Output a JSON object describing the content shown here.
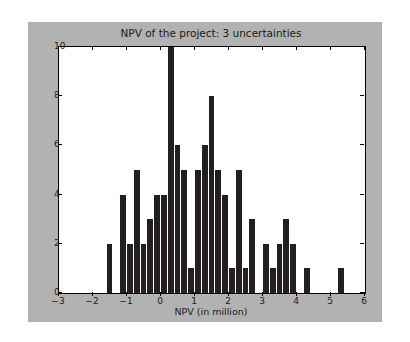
{
  "figure": {
    "background_color": "#b2b2b2",
    "page_background_color": "#ffffff",
    "axes_background_color": "#ffffff",
    "bar_color": "#231f20",
    "frame_color": "#000000"
  },
  "chart_data": {
    "type": "bar",
    "chart_subtype": "histogram",
    "title": "NPV of the project: 3 uncertainties",
    "xlabel": "NPV (in million)",
    "ylabel": "",
    "xlim": [
      -3,
      6
    ],
    "ylim": [
      0,
      10
    ],
    "grid": false,
    "legend": null,
    "xticks": [
      -3,
      -2,
      -1,
      0,
      1,
      2,
      3,
      4,
      5,
      6
    ],
    "xtick_labels": [
      "−3",
      "−2",
      "−1",
      "0",
      "1",
      "2",
      "3",
      "4",
      "5",
      "6"
    ],
    "yticks": [
      0,
      2,
      4,
      6,
      8,
      10
    ],
    "ytick_labels": [
      "0",
      "2",
      "4",
      "6",
      "8",
      "10"
    ],
    "bin_width": 0.2,
    "bins": [
      {
        "x0": -1.6,
        "x1": -1.4,
        "value": 2
      },
      {
        "x0": -1.4,
        "x1": -1.2,
        "value": 0
      },
      {
        "x0": -1.2,
        "x1": -1.0,
        "value": 4
      },
      {
        "x0": -1.0,
        "x1": -0.8,
        "value": 2
      },
      {
        "x0": -0.8,
        "x1": -0.6,
        "value": 5
      },
      {
        "x0": -0.6,
        "x1": -0.4,
        "value": 2
      },
      {
        "x0": -0.4,
        "x1": -0.2,
        "value": 3
      },
      {
        "x0": -0.2,
        "x1": 0.0,
        "value": 4
      },
      {
        "x0": 0.0,
        "x1": 0.2,
        "value": 4
      },
      {
        "x0": 0.2,
        "x1": 0.4,
        "value": 10
      },
      {
        "x0": 0.4,
        "x1": 0.6,
        "value": 6
      },
      {
        "x0": 0.6,
        "x1": 0.8,
        "value": 5
      },
      {
        "x0": 0.8,
        "x1": 1.0,
        "value": 1
      },
      {
        "x0": 1.0,
        "x1": 1.2,
        "value": 5
      },
      {
        "x0": 1.2,
        "x1": 1.4,
        "value": 6
      },
      {
        "x0": 1.4,
        "x1": 1.6,
        "value": 8
      },
      {
        "x0": 1.6,
        "x1": 1.8,
        "value": 5
      },
      {
        "x0": 1.8,
        "x1": 2.0,
        "value": 4
      },
      {
        "x0": 2.0,
        "x1": 2.2,
        "value": 1
      },
      {
        "x0": 2.2,
        "x1": 2.4,
        "value": 5
      },
      {
        "x0": 2.4,
        "x1": 2.6,
        "value": 1
      },
      {
        "x0": 2.6,
        "x1": 2.8,
        "value": 3
      },
      {
        "x0": 2.8,
        "x1": 3.0,
        "value": 0
      },
      {
        "x0": 3.0,
        "x1": 3.2,
        "value": 2
      },
      {
        "x0": 3.2,
        "x1": 3.4,
        "value": 1
      },
      {
        "x0": 3.4,
        "x1": 3.6,
        "value": 2
      },
      {
        "x0": 3.6,
        "x1": 3.8,
        "value": 3
      },
      {
        "x0": 3.8,
        "x1": 4.0,
        "value": 2
      },
      {
        "x0": 4.0,
        "x1": 4.2,
        "value": 0
      },
      {
        "x0": 4.2,
        "x1": 4.4,
        "value": 1
      },
      {
        "x0": 4.4,
        "x1": 4.6,
        "value": 0
      },
      {
        "x0": 4.6,
        "x1": 4.8,
        "value": 0
      },
      {
        "x0": 4.8,
        "x1": 5.0,
        "value": 0
      },
      {
        "x0": 5.0,
        "x1": 5.2,
        "value": 0
      },
      {
        "x0": 5.2,
        "x1": 5.4,
        "value": 1
      }
    ]
  }
}
